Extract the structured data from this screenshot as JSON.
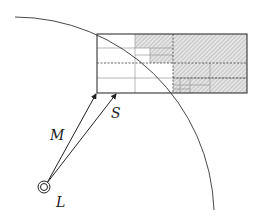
{
  "diagram": {
    "labels": {
      "M": "M",
      "S": "S",
      "L": "L"
    },
    "colors": {
      "stroke": "#333333",
      "grid_light": "#9a9a9a",
      "hatch": "#b5b5b5",
      "background": "#ffffff"
    },
    "elements": {
      "arc": "circular arc boundary (observer range)",
      "grid": "rectangular quadtree-like grid, cells beyond arc hatched",
      "source": "double circle at L",
      "rays": [
        "M",
        "S"
      ]
    }
  }
}
